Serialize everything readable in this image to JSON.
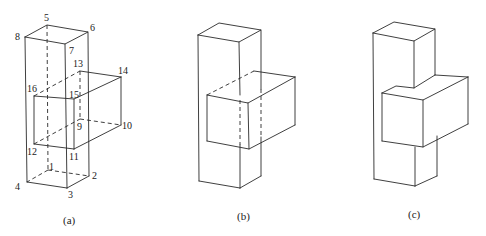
{
  "figures": [
    {
      "id": "a",
      "caption": "(a)",
      "description": "Wireframe of a vertical column with a horizontal box intersecting it, all hidden edges shown dashed, vertices numbered",
      "vertex_labels": {
        "1": "1",
        "2": "2",
        "3": "3",
        "4": "4",
        "5": "5",
        "6": "6",
        "7": "7",
        "8": "8",
        "9": "9",
        "10": "10",
        "11": "11",
        "12": "12",
        "13": "13",
        "14": "14",
        "15": "15",
        "16": "16"
      }
    },
    {
      "id": "b",
      "caption": "(b)",
      "description": "Same solids with hidden lines partially removed; intersection edges dashed"
    },
    {
      "id": "c",
      "caption": "(c)",
      "description": "Final hidden-line-removed rendering of column and box"
    }
  ],
  "colors": {
    "line": "#2a2a2a",
    "background": "#ffffff"
  }
}
